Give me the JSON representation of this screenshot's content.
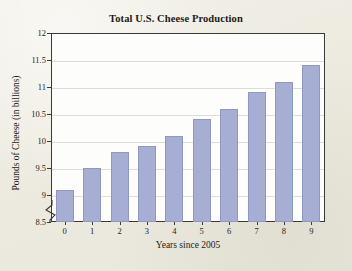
{
  "figure": {
    "background_color": "#efede5",
    "plot_background_color": "#fdfdfb",
    "frame_color": "#3a3a38"
  },
  "chart_data": {
    "type": "bar",
    "title": "Total U.S. Cheese Production",
    "xlabel": "Years since 2005",
    "ylabel": "Pounds of Cheese (in billions)",
    "categories": [
      "0",
      "1",
      "2",
      "3",
      "4",
      "5",
      "6",
      "7",
      "8",
      "9"
    ],
    "values": [
      9.1,
      9.5,
      9.8,
      9.9,
      10.1,
      10.4,
      10.6,
      10.9,
      11.1,
      11.4
    ],
    "ylim": [
      8.5,
      12
    ],
    "yticks": [
      "8.5",
      "9",
      "9.5",
      "10",
      "10.5",
      "11",
      "11.5",
      "12"
    ],
    "ytick_values": [
      8.5,
      9,
      9.5,
      10,
      10.5,
      11,
      11.5,
      12
    ],
    "axis_break": true,
    "axis_break_note": "y-axis broken below 8.5",
    "grid": true,
    "grid_color": "#dcdcd8",
    "bar_color": "#a7aed3",
    "bar_edge_color": "#9097c2",
    "legend": null
  }
}
